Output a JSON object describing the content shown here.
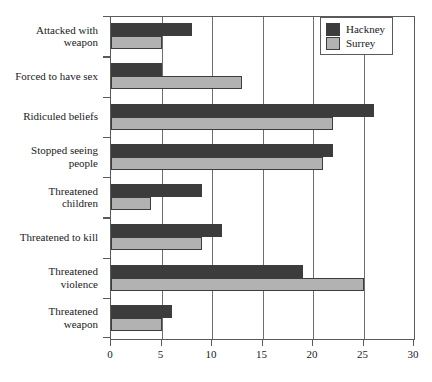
{
  "chart_data": {
    "type": "bar",
    "orientation": "horizontal",
    "title": "",
    "subtitle": "",
    "xlabel": "",
    "ylabel": "",
    "xlim": [
      0,
      30
    ],
    "xticks": [
      0,
      5,
      10,
      15,
      20,
      25,
      30
    ],
    "xtick_labels": [
      "0",
      "5",
      "10",
      "15",
      "20",
      "25",
      "30"
    ],
    "grid": true,
    "grid_axis": "x",
    "legend_position": "top-right",
    "categories": [
      "Attacked with weapon",
      "Forced to have sex",
      "Ridiculed beliefs",
      "Stopped seeing people",
      "Threatened children",
      "Threatened to kill",
      "Threatened violence",
      "Threatened weapon"
    ],
    "category_lines": [
      [
        "Attacked with",
        "weapon"
      ],
      [
        "Forced to have sex"
      ],
      [
        "Ridiculed beliefs"
      ],
      [
        "Stopped seeing",
        "people"
      ],
      [
        "Threatened",
        "children"
      ],
      [
        "Threatened to kill"
      ],
      [
        "Threatened",
        "violence"
      ],
      [
        "Threatened",
        "weapon"
      ]
    ],
    "series": [
      {
        "name": "Hackney",
        "color": "#3c3c3c",
        "values": [
          8,
          5,
          26,
          22,
          9,
          11,
          19,
          6
        ]
      },
      {
        "name": "Surrey",
        "color": "#b2b2b2",
        "values": [
          5,
          13,
          22,
          21,
          4,
          9,
          25,
          5
        ]
      }
    ]
  },
  "legend": {
    "entries": [
      {
        "label": "Hackney",
        "color": "#3c3c3c"
      },
      {
        "label": "Surrey",
        "color": "#b2b2b2"
      }
    ]
  },
  "style": {
    "axis_color": "#5a5a5a",
    "grid_color": "#6e6e6e",
    "text_color": "#1a1a1a",
    "background": "#ffffff"
  }
}
